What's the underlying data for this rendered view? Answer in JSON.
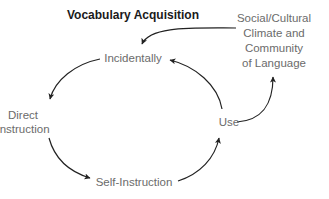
{
  "title": "Vocabulary Acquisition",
  "nodes": {
    "incidentally": "Incidentally",
    "direct_instruction": [
      "Direct",
      "Instruction"
    ],
    "self_instruction": "Self-Instruction",
    "use": "Use",
    "social_cultural": [
      "Social/Cultural",
      "Climate and",
      "Community",
      "of Language"
    ]
  },
  "edges": [
    {
      "from": "Social/Cultural Climate and Community of Language",
      "to": "Incidentally"
    },
    {
      "from": "Incidentally",
      "to": "Direct Instruction"
    },
    {
      "from": "Direct Instruction",
      "to": "Self-Instruction"
    },
    {
      "from": "Self-Instruction",
      "to": "Use"
    },
    {
      "from": "Use",
      "to": "Incidentally"
    },
    {
      "from": "Use",
      "to": "Social/Cultural Climate and Community of Language"
    }
  ],
  "colors": {
    "text": "#6b6b6b",
    "title": "#1a1a1a",
    "arrow": "#222222"
  }
}
